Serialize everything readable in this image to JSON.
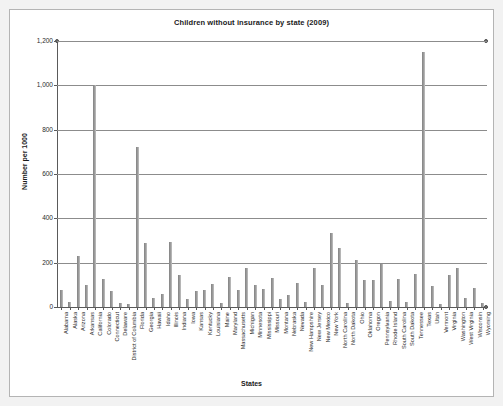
{
  "chart_data": {
    "type": "bar",
    "title": "Children without insurance by state (2009)",
    "xlabel": "States",
    "ylabel": "Number per 1000",
    "ylim": [
      0,
      1200
    ],
    "yticks": [
      0,
      200,
      400,
      600,
      800,
      1000,
      1200
    ],
    "ytick_labels": [
      "0",
      "200",
      "400",
      "600",
      "800",
      "1,000",
      "1,200"
    ],
    "grid": true,
    "legend": "none",
    "bar_color": "#9a9a9a",
    "categories": [
      "Alabama",
      "Alaska",
      "Arizona",
      "Arkansas",
      "California",
      "Colorado",
      "Connecticut",
      "Delaware",
      "District of Columbia",
      "Florida",
      "Georgia",
      "Hawaii",
      "Idaho",
      "Illinois",
      "Indiana",
      "Iowa",
      "Kansas",
      "Kentucky",
      "Louisiana",
      "Maine",
      "Maryland",
      "Massachusetts",
      "Michigan",
      "Minnesota",
      "Mississippi",
      "Missouri",
      "Montana",
      "Nebraska",
      "Nevada",
      "New Hampshire",
      "New Jersey",
      "New Mexico",
      "New York",
      "North Carolina",
      "North Dakota",
      "Ohio",
      "Oklahoma",
      "Oregon",
      "Pennsylvania",
      "Rhode Island",
      "South Carolina",
      "South Dakota",
      "Tennessee",
      "Texas",
      "Utah",
      "Vermont",
      "Virginia",
      "Washington",
      "West Virginia",
      "Wisconsin",
      "Wyoming"
    ],
    "values": [
      75,
      22,
      230,
      100,
      1000,
      128,
      70,
      20,
      15,
      720,
      290,
      42,
      60,
      295,
      145,
      38,
      70,
      75,
      105,
      18,
      135,
      75,
      175,
      100,
      80,
      130,
      35,
      52,
      110,
      22,
      175,
      100,
      335,
      265,
      18,
      210,
      120,
      120,
      195,
      25,
      125,
      22,
      150,
      1150,
      95,
      14,
      145,
      175,
      40,
      85,
      20
    ]
  }
}
